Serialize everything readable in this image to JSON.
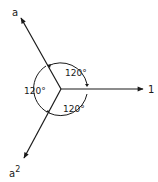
{
  "diagram": {
    "type": "phasor-diagram",
    "center": [
      61,
      89
    ],
    "phasors": [
      {
        "label": "1",
        "angle_deg": 0,
        "end": [
          143,
          89
        ],
        "label_pos": [
          150,
          93
        ]
      },
      {
        "label": "a",
        "angle_deg": 120,
        "end": [
          21,
          18
        ],
        "label_pos": [
          15,
          15
        ]
      },
      {
        "label": "a",
        "superscript": "2",
        "angle_deg": 240,
        "end": [
          24,
          158
        ],
        "label_pos": [
          11,
          176
        ]
      }
    ],
    "angles": [
      {
        "label": "120°",
        "between": [
          "1",
          "a"
        ],
        "label_pos": [
          66,
          74
        ]
      },
      {
        "label": "120°",
        "between": [
          "a",
          "a2"
        ],
        "label_pos": [
          24,
          93
        ]
      },
      {
        "label": "120°",
        "between": [
          "a2",
          "1"
        ],
        "label_pos": [
          64,
          111
        ]
      }
    ],
    "colors": {
      "line": "#1a1a1a",
      "background": "#ffffff"
    }
  }
}
